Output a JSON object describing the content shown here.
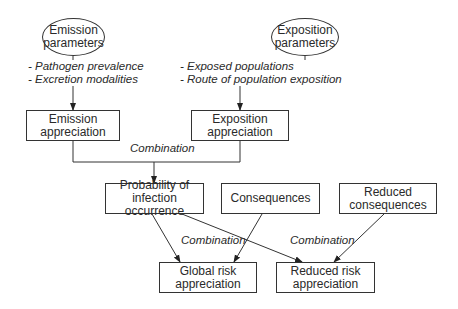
{
  "diagram": {
    "nodes": {
      "emission_parameters": {
        "line1": "Emission",
        "line2": "parameters"
      },
      "exposition_parameters": {
        "line1": "Exposition",
        "line2": "parameters"
      },
      "emission_appreciation": {
        "line1": "Emission",
        "line2": "appreciation"
      },
      "exposition_appreciation": {
        "line1": "Exposition",
        "line2": "appreciation"
      },
      "probability": {
        "line1": "Probability of infection",
        "line2": "occurrence"
      },
      "consequences": {
        "line1": "Consequences"
      },
      "reduced_consequences": {
        "line1": "Reduced",
        "line2": "consequences"
      },
      "global_risk": {
        "line1": "Global risk",
        "line2": "appreciation"
      },
      "reduced_risk": {
        "line1": "Reduced risk",
        "line2": "appreciation"
      }
    },
    "emission_factors": [
      "- Pathogen prevalence",
      "- Excretion modalities"
    ],
    "exposition_factors": [
      "- Exposed populations",
      "- Route of population exposition"
    ],
    "edge_labels": {
      "top_combination": "Combination",
      "left_combination": "Combination",
      "right_combination": "Combination"
    }
  }
}
